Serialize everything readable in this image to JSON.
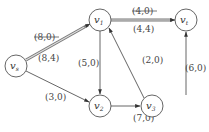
{
  "diagram": {
    "type": "flow-network",
    "nodes": [
      {
        "id": "vs",
        "label": "v",
        "sub": "s",
        "x": 16,
        "y": 66
      },
      {
        "id": "v1",
        "label": "v",
        "sub": "1",
        "x": 100,
        "y": 20
      },
      {
        "id": "vt",
        "label": "v",
        "sub": "t",
        "x": 186,
        "y": 20
      },
      {
        "id": "v2",
        "label": "v",
        "sub": "2",
        "x": 100,
        "y": 106
      },
      {
        "id": "v3",
        "label": "v",
        "sub": "3",
        "x": 152,
        "y": 106
      }
    ],
    "edges": [
      {
        "from": "vs",
        "to": "v1",
        "label_old": "(8,0)",
        "label": "(8,4)",
        "highlighted": true
      },
      {
        "from": "v1",
        "to": "vt",
        "label_old": "(4,0)",
        "label": "(4,4)",
        "highlighted": true
      },
      {
        "from": "v1",
        "to": "v2",
        "label": "(5,0)"
      },
      {
        "from": "v3",
        "to": "v1",
        "label": "(2,0)"
      },
      {
        "from": "vs",
        "to": "v2",
        "label": "(3,0)"
      },
      {
        "from": "v2",
        "to": "v3",
        "label": "(7,0)"
      },
      {
        "from": "v3",
        "to": "vt",
        "label": "(6,0)"
      }
    ]
  }
}
